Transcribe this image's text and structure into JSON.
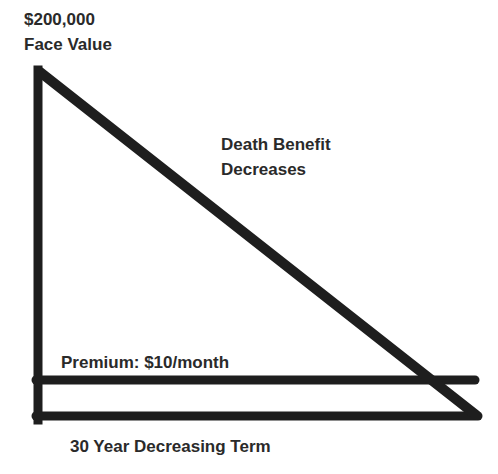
{
  "labels": {
    "face_amount": "$200,000",
    "face_value": "Face Value",
    "death_benefit_line1": "Death Benefit",
    "death_benefit_line2": "Decreases",
    "premium": "Premium: $10/month",
    "term": "30 Year Decreasing Term"
  },
  "colors": {
    "line": "#1e1e1e",
    "text": "#2a2a2a",
    "background": "#ffffff"
  }
}
